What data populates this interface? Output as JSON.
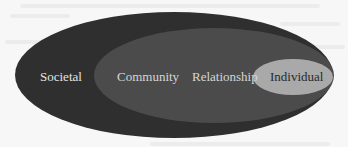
{
  "diagram": {
    "type": "nested-ellipses",
    "levels": [
      {
        "label": "Societal",
        "color": "#2f2f2f",
        "text_color": "#e4e4e4"
      },
      {
        "label": "Community",
        "color": "#4b4b4b",
        "text_color": "#d6d6d6"
      },
      {
        "label": "Relationship",
        "color": "#4b4b4b",
        "text_color": "#d6d6d6"
      },
      {
        "label": "Individual",
        "color": "#a9a9a9",
        "text_color": "#2a2a2a"
      }
    ]
  }
}
